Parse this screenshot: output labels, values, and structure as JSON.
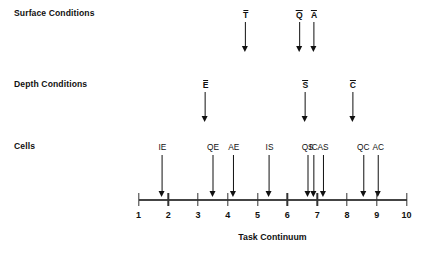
{
  "figure": {
    "axis_title": "Task Continuum",
    "rows": [
      {
        "key": "surface",
        "label": "Surface Conditions"
      },
      {
        "key": "depth",
        "label": "Depth Conditions"
      },
      {
        "key": "cells",
        "label": "Cells"
      }
    ]
  },
  "chart_data": {
    "type": "scatter",
    "title": "",
    "xlabel": "Task Continuum",
    "ylabel": "",
    "xlim": [
      1,
      10
    ],
    "ylim": [
      0,
      3
    ],
    "grid": false,
    "legend": null,
    "x_ticks": [
      1,
      2,
      3,
      4,
      5,
      6,
      7,
      8,
      9,
      10
    ],
    "x_tick_labels": [
      "1",
      "2",
      "3",
      "4",
      "5",
      "6",
      "7",
      "8",
      "9",
      "10"
    ],
    "annotation_style": "downward arrow with label above",
    "series": [
      {
        "name": "Surface Conditions",
        "points": [
          {
            "label": "T",
            "overbar": true,
            "x": 4.6
          },
          {
            "label": "Q",
            "overbar": true,
            "x": 6.4
          },
          {
            "label": "A",
            "overbar": true,
            "x": 6.9
          }
        ]
      },
      {
        "name": "Depth Conditions",
        "points": [
          {
            "label": "E",
            "overbar": true,
            "x": 3.25
          },
          {
            "label": "S",
            "overbar": true,
            "x": 6.6
          },
          {
            "label": "C",
            "overbar": true,
            "x": 8.2
          }
        ]
      },
      {
        "name": "Cells",
        "points": [
          {
            "label": "IE",
            "overbar": false,
            "x": 1.8
          },
          {
            "label": "QE",
            "overbar": false,
            "x": 3.5
          },
          {
            "label": "AE",
            "overbar": false,
            "x": 4.2
          },
          {
            "label": "IS",
            "overbar": false,
            "x": 5.4
          },
          {
            "label": "QS",
            "overbar": false,
            "x": 6.68
          },
          {
            "label": "IC",
            "overbar": false,
            "x": 6.88
          },
          {
            "label": "AS",
            "overbar": false,
            "x": 7.2
          },
          {
            "label": "QC",
            "overbar": false,
            "x": 8.55
          },
          {
            "label": "AC",
            "overbar": false,
            "x": 9.05
          }
        ]
      }
    ],
    "colors": {
      "ink": "#111111",
      "axis": "#444444",
      "background": "#ffffff"
    }
  }
}
